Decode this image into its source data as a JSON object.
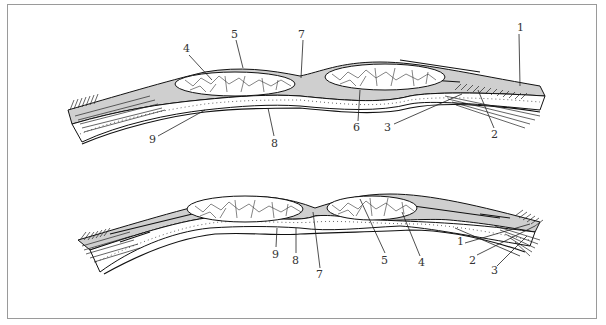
{
  "figure": {
    "type": "anatomical cross-section diagram",
    "panels": [
      {
        "id": "upper",
        "labels": [
          {
            "text": "1",
            "x": 517,
            "y": 31
          },
          {
            "text": "2",
            "x": 493,
            "y": 136
          },
          {
            "text": "3",
            "x": 388,
            "y": 129
          },
          {
            "text": "4",
            "x": 185,
            "y": 52
          },
          {
            "text": "5",
            "x": 233,
            "y": 38
          },
          {
            "text": "6",
            "x": 355,
            "y": 129
          },
          {
            "text": "7",
            "x": 299,
            "y": 38
          },
          {
            "text": "8",
            "x": 273,
            "y": 144
          },
          {
            "text": "9",
            "x": 150,
            "y": 141
          }
        ]
      },
      {
        "id": "lower",
        "labels": [
          {
            "text": "9",
            "x": 273,
            "y": 256
          },
          {
            "text": "8",
            "x": 294,
            "y": 262
          },
          {
            "text": "7",
            "x": 318,
            "y": 276
          },
          {
            "text": "5",
            "x": 383,
            "y": 262
          },
          {
            "text": "4",
            "x": 420,
            "y": 264
          },
          {
            "text": "1",
            "x": 459,
            "y": 243
          },
          {
            "text": "2",
            "x": 471,
            "y": 262
          },
          {
            "text": "3",
            "x": 493,
            "y": 272
          }
        ]
      }
    ]
  }
}
